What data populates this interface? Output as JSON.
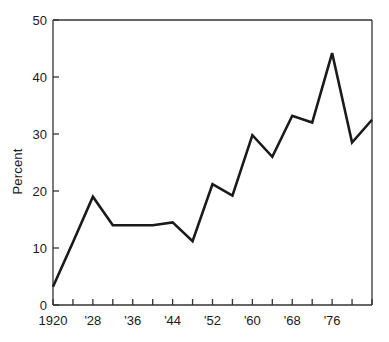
{
  "chart_data": {
    "type": "line",
    "title": "",
    "subtitle": "",
    "xlabel": "",
    "ylabel": "Percent",
    "xlim": [
      1920,
      1984
    ],
    "ylim": [
      0,
      50
    ],
    "grid": false,
    "legend": null,
    "y_ticks": [
      0,
      10,
      20,
      30,
      40,
      50
    ],
    "y_tick_labels": [
      "0",
      "10",
      "20",
      "30",
      "40",
      "50"
    ],
    "x_ticks": [
      1920,
      1924,
      1928,
      1932,
      1936,
      1940,
      1944,
      1948,
      1952,
      1956,
      1960,
      1964,
      1968,
      1972,
      1976,
      1980,
      1984
    ],
    "x_tick_labels": [
      {
        "value": 1920,
        "label": "1920"
      },
      {
        "value": 1928,
        "label": "'28"
      },
      {
        "value": 1936,
        "label": "'36"
      },
      {
        "value": 1944,
        "label": "'44"
      },
      {
        "value": 1952,
        "label": "'52"
      },
      {
        "value": 1960,
        "label": "'60"
      },
      {
        "value": 1968,
        "label": "'68"
      },
      {
        "value": 1976,
        "label": "'76"
      }
    ],
    "x": [
      1920,
      1924,
      1928,
      1932,
      1936,
      1940,
      1944,
      1948,
      1952,
      1956,
      1960,
      1964,
      1968,
      1972,
      1976,
      1980,
      1984
    ],
    "values": [
      3.2,
      11.0,
      19.0,
      14.0,
      14.0,
      14.0,
      14.5,
      11.2,
      21.2,
      19.2,
      29.8,
      26.0,
      33.2,
      32.0,
      44.2,
      28.5,
      32.5
    ],
    "series": [
      {
        "name": "Percent",
        "color": "#1a1a1a",
        "values": [
          3.2,
          11.0,
          19.0,
          14.0,
          14.0,
          14.0,
          14.5,
          11.2,
          21.2,
          19.2,
          29.8,
          26.0,
          33.2,
          32.0,
          44.2,
          28.5,
          32.5
        ]
      }
    ],
    "line_color": "#1a1a1a",
    "line_width": 2.6,
    "axis_color": "#333333",
    "background": "#ffffff"
  }
}
